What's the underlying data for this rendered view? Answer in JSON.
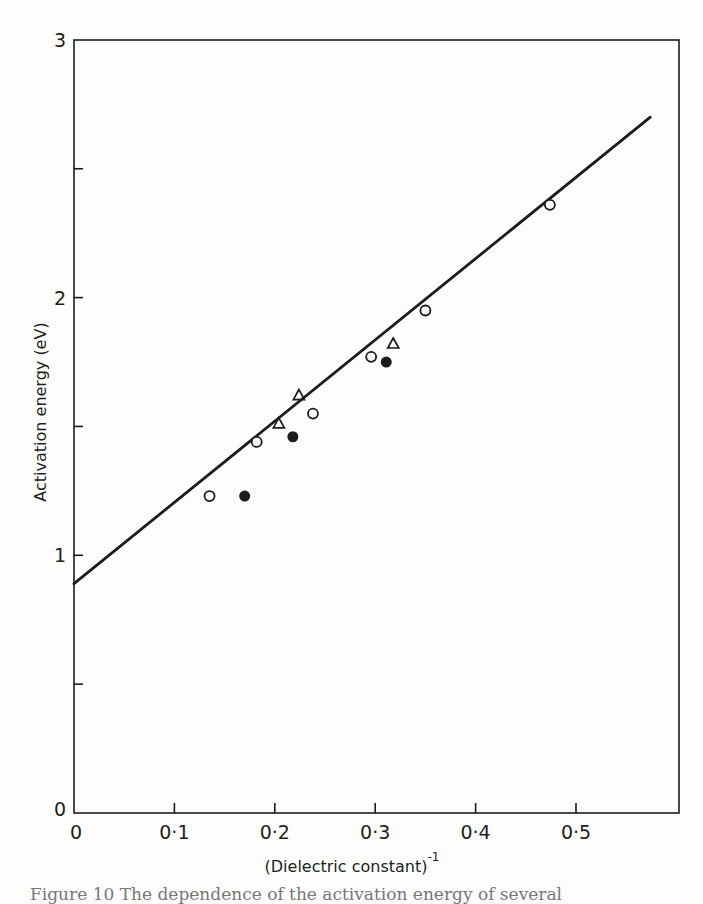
{
  "chart_data": {
    "type": "scatter",
    "title": "",
    "xlabel": "(Dielectric constant)",
    "xlabel_superscript": "-1",
    "ylabel": "Activation energy (eV)",
    "xlim": [
      0,
      0.6
    ],
    "ylim": [
      0,
      3
    ],
    "x_ticks": [
      0,
      0.1,
      0.2,
      0.3,
      0.4,
      0.5
    ],
    "x_tick_labels": [
      "0",
      "0·1",
      "0·2",
      "0·3",
      "0·4",
      "0·5"
    ],
    "y_ticks": [
      0,
      0.5,
      1,
      1.5,
      2,
      2.5,
      3
    ],
    "y_tick_labels": [
      "0",
      "",
      "1",
      "",
      "2",
      "",
      "3"
    ],
    "grid": false,
    "legend": null,
    "series": [
      {
        "name": "open circles",
        "marker": "circle-open",
        "points": [
          [
            0.135,
            1.23
          ],
          [
            0.182,
            1.44
          ],
          [
            0.238,
            1.55
          ],
          [
            0.296,
            1.77
          ],
          [
            0.35,
            1.95
          ],
          [
            0.474,
            2.36
          ]
        ]
      },
      {
        "name": "open triangles",
        "marker": "triangle-open",
        "points": [
          [
            0.204,
            1.51
          ],
          [
            0.224,
            1.62
          ],
          [
            0.318,
            1.82
          ]
        ]
      },
      {
        "name": "filled circles",
        "marker": "circle-filled",
        "points": [
          [
            0.17,
            1.23
          ],
          [
            0.218,
            1.46
          ],
          [
            0.311,
            1.75
          ]
        ]
      }
    ],
    "fit_line": {
      "type": "linear",
      "start": [
        0,
        0.89
      ],
      "end": [
        0.574,
        2.7
      ],
      "slope": 3.15,
      "intercept": 0.89
    }
  },
  "caption": {
    "text": "Figure 10  The dependence of the activation energy of several"
  }
}
